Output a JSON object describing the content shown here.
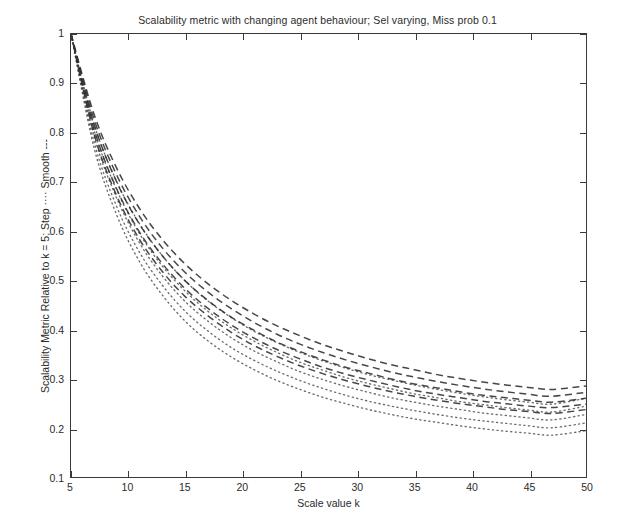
{
  "chart_data": {
    "type": "line",
    "title": "Scalability metric with changing agent behaviour; Sel varying, Miss prob 0.1",
    "xlabel": "Scale value k",
    "ylabel": "Scalability Metric Relative to k = 5; Step ···· Smooth ---",
    "xlim": [
      5,
      50
    ],
    "ylim": [
      0.1,
      1
    ],
    "xticks": [
      5,
      10,
      15,
      20,
      25,
      30,
      35,
      40,
      45,
      50
    ],
    "yticks": [
      0.1,
      0.2,
      0.3,
      0.4,
      0.5,
      0.6,
      0.7,
      0.8,
      0.9,
      1
    ],
    "xtick_labels": [
      "5",
      "10",
      "15",
      "20",
      "25",
      "30",
      "35",
      "40",
      "45",
      "50"
    ],
    "ytick_labels": [
      "0.1",
      "0.2",
      "0.3",
      "0.4",
      "0.5",
      "0.6",
      "0.7",
      "0.8",
      "0.9",
      "1"
    ],
    "grid": false,
    "legend": "inline-in-ylabel",
    "line_color": "#333333",
    "x": [
      5,
      7,
      9,
      11,
      13,
      15,
      17,
      19,
      21,
      23,
      25,
      27,
      29,
      31,
      33,
      35,
      37,
      39,
      41,
      43,
      45,
      47,
      50
    ],
    "series": [
      {
        "name": "Smooth, Sel 1",
        "style": "dashed",
        "values": [
          1.0,
          0.838,
          0.727,
          0.645,
          0.582,
          0.532,
          0.492,
          0.459,
          0.431,
          0.407,
          0.387,
          0.369,
          0.354,
          0.34,
          0.328,
          0.318,
          0.308,
          0.3,
          0.293,
          0.287,
          0.282,
          0.278,
          0.285
        ]
      },
      {
        "name": "Smooth, Sel 2",
        "style": "dashed",
        "values": [
          1.0,
          0.828,
          0.713,
          0.629,
          0.565,
          0.515,
          0.475,
          0.442,
          0.414,
          0.39,
          0.37,
          0.353,
          0.338,
          0.325,
          0.313,
          0.303,
          0.294,
          0.286,
          0.279,
          0.273,
          0.268,
          0.264,
          0.272
        ]
      },
      {
        "name": "Smooth, Sel 3",
        "style": "dashed",
        "values": [
          1.0,
          0.818,
          0.699,
          0.613,
          0.549,
          0.498,
          0.458,
          0.425,
          0.398,
          0.374,
          0.355,
          0.338,
          0.323,
          0.311,
          0.299,
          0.289,
          0.281,
          0.273,
          0.266,
          0.261,
          0.256,
          0.252,
          0.26
        ]
      },
      {
        "name": "Smooth, Sel 4",
        "style": "dashed",
        "values": [
          1.0,
          0.808,
          0.685,
          0.597,
          0.533,
          0.482,
          0.442,
          0.409,
          0.382,
          0.359,
          0.34,
          0.323,
          0.309,
          0.297,
          0.286,
          0.276,
          0.268,
          0.261,
          0.254,
          0.249,
          0.244,
          0.241,
          0.248
        ]
      },
      {
        "name": "Smooth, Sel 5",
        "style": "dashed",
        "values": [
          1.0,
          0.798,
          0.671,
          0.582,
          0.517,
          0.466,
          0.427,
          0.394,
          0.367,
          0.345,
          0.326,
          0.31,
          0.296,
          0.284,
          0.273,
          0.264,
          0.256,
          0.249,
          0.243,
          0.237,
          0.233,
          0.229,
          0.237
        ]
      },
      {
        "name": "Step, Sel 1",
        "style": "dotted",
        "values": [
          1.0,
          0.818,
          0.7,
          0.614,
          0.549,
          0.498,
          0.457,
          0.424,
          0.396,
          0.373,
          0.353,
          0.336,
          0.321,
          0.308,
          0.297,
          0.287,
          0.278,
          0.27,
          0.263,
          0.257,
          0.252,
          0.248,
          0.26
        ]
      },
      {
        "name": "Step, Sel 2",
        "style": "dotted",
        "values": [
          1.0,
          0.806,
          0.683,
          0.594,
          0.528,
          0.477,
          0.436,
          0.403,
          0.376,
          0.353,
          0.333,
          0.317,
          0.302,
          0.29,
          0.279,
          0.269,
          0.261,
          0.253,
          0.247,
          0.241,
          0.236,
          0.232,
          0.244
        ]
      },
      {
        "name": "Step, Sel 3",
        "style": "dotted",
        "values": [
          1.0,
          0.794,
          0.666,
          0.575,
          0.508,
          0.456,
          0.416,
          0.383,
          0.356,
          0.334,
          0.314,
          0.298,
          0.284,
          0.272,
          0.261,
          0.252,
          0.244,
          0.237,
          0.23,
          0.225,
          0.22,
          0.216,
          0.227
        ]
      },
      {
        "name": "Step, Sel 4",
        "style": "dotted",
        "values": [
          1.0,
          0.782,
          0.649,
          0.556,
          0.489,
          0.436,
          0.396,
          0.363,
          0.337,
          0.315,
          0.296,
          0.28,
          0.266,
          0.254,
          0.244,
          0.235,
          0.227,
          0.22,
          0.214,
          0.209,
          0.204,
          0.2,
          0.21
        ]
      },
      {
        "name": "Step, Sel 5",
        "style": "dotted",
        "values": [
          1.0,
          0.77,
          0.632,
          0.537,
          0.469,
          0.416,
          0.376,
          0.344,
          0.318,
          0.296,
          0.278,
          0.262,
          0.249,
          0.237,
          0.227,
          0.218,
          0.211,
          0.204,
          0.198,
          0.193,
          0.189,
          0.185,
          0.194
        ]
      }
    ]
  }
}
